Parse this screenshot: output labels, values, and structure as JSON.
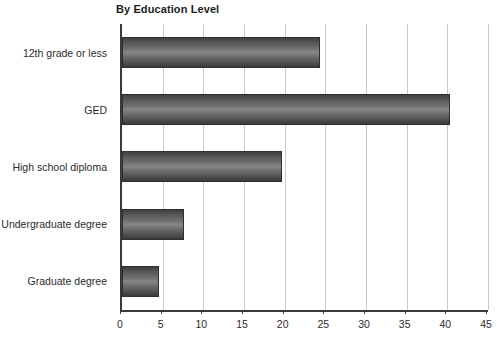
{
  "chart": {
    "title": "By Education Level",
    "xlabel": "",
    "ylabel": ""
  },
  "axis": {
    "ticks": [
      "0",
      "5",
      "10",
      "15",
      "20",
      "25",
      "30",
      "35",
      "40",
      "45"
    ]
  },
  "categories": [
    "12th grade or less",
    "GED",
    "High school diploma",
    "Undergraduate degree",
    "Graduate degree"
  ],
  "colors": {
    "bar_dark": "#3a3a3a",
    "bar_light": "#868686",
    "gridline": "#c9c9c9",
    "axis": "#3a3a3a",
    "text": "#2b2b2b",
    "background": "#ffffff"
  },
  "chart_data": {
    "type": "bar",
    "orientation": "horizontal",
    "title": "By Education Level",
    "categories": [
      "12th grade or less",
      "GED",
      "High school diploma",
      "Undergraduate degree",
      "Graduate degree"
    ],
    "values": [
      24.3,
      40.3,
      19.7,
      7.6,
      4.6
    ],
    "xlabel": "",
    "ylabel": "",
    "xlim": [
      0,
      45
    ],
    "xticks": [
      0,
      5,
      10,
      15,
      20,
      25,
      30,
      35,
      40,
      45
    ],
    "grid": "vertical",
    "legend": "none"
  }
}
